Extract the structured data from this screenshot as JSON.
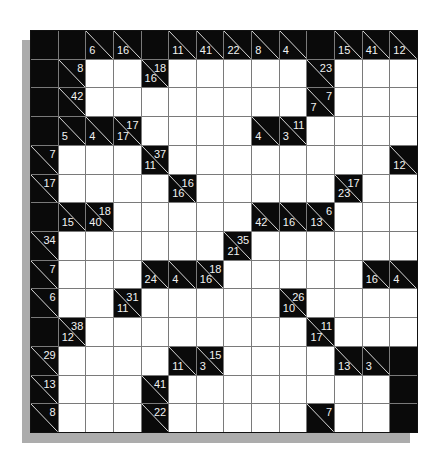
{
  "puzzle": {
    "type": "kakuro",
    "rows": 14,
    "cols": 14,
    "legend": {
      "b": "black-cell",
      "w": "white-entry-cell",
      "clue": "d = down sum (lower-left), a = across sum (upper-right)"
    },
    "grid": [
      [
        "b",
        "b",
        {
          "d": "6"
        },
        {
          "d": "16"
        },
        "b",
        {
          "d": "11"
        },
        {
          "d": "41"
        },
        {
          "d": "22"
        },
        {
          "d": "8"
        },
        {
          "d": "4"
        },
        "b",
        {
          "d": "15"
        },
        {
          "d": "41"
        },
        {
          "d": "12"
        }
      ],
      [
        "b",
        {
          "a": "8"
        },
        "w",
        "w",
        {
          "d": "16",
          "a": "18"
        },
        "w",
        "w",
        "w",
        "w",
        "w",
        {
          "a": "23"
        },
        "w",
        "w",
        "w"
      ],
      [
        "b",
        {
          "a": "42"
        },
        "w",
        "w",
        "w",
        "w",
        "w",
        "w",
        "w",
        "w",
        {
          "d": "7",
          "a": "7"
        },
        "w",
        "w",
        "w"
      ],
      [
        "b",
        {
          "d": "5"
        },
        {
          "d": "4"
        },
        {
          "d": "17",
          "a": "17"
        },
        "w",
        "w",
        "w",
        "w",
        {
          "d": "4"
        },
        {
          "d": "3",
          "a": "11"
        },
        "w",
        "w",
        "w",
        "w"
      ],
      [
        {
          "a": "7"
        },
        "w",
        "w",
        "w",
        {
          "d": "11",
          "a": "37"
        },
        "w",
        "w",
        "w",
        "w",
        "w",
        "w",
        "w",
        "w",
        {
          "d": "12"
        }
      ],
      [
        {
          "a": "17"
        },
        "w",
        "w",
        "w",
        "w",
        {
          "d": "16",
          "a": "16"
        },
        "w",
        "w",
        "w",
        "w",
        "w",
        {
          "d": "23",
          "a": "17"
        },
        "w",
        "w"
      ],
      [
        "b",
        {
          "d": "15"
        },
        {
          "d": "40",
          "a": "18"
        },
        "w",
        "w",
        "w",
        "w",
        "w",
        {
          "d": "42"
        },
        {
          "d": "16"
        },
        {
          "d": "13",
          "a": "6"
        },
        "w",
        "w",
        "w"
      ],
      [
        {
          "a": "34"
        },
        "w",
        "w",
        "w",
        "w",
        "w",
        "w",
        {
          "d": "21",
          "a": "35"
        },
        "w",
        "w",
        "w",
        "w",
        "w",
        "w"
      ],
      [
        {
          "a": "7"
        },
        "w",
        "w",
        "w",
        {
          "d": "24"
        },
        {
          "d": "4"
        },
        {
          "d": "16",
          "a": "18"
        },
        "w",
        "w",
        "w",
        "w",
        "w",
        {
          "d": "16"
        },
        {
          "d": "4"
        }
      ],
      [
        {
          "a": "6"
        },
        "w",
        "w",
        {
          "d": "11",
          "a": "31"
        },
        "w",
        "w",
        "w",
        "w",
        "w",
        {
          "d": "10",
          "a": "26"
        },
        "w",
        "w",
        "w",
        "w"
      ],
      [
        "b",
        {
          "d": "12",
          "a": "38"
        },
        "w",
        "w",
        "w",
        "w",
        "w",
        "w",
        "w",
        "w",
        {
          "d": "17",
          "a": "11"
        },
        "w",
        "w",
        "w"
      ],
      [
        {
          "a": "29"
        },
        "w",
        "w",
        "w",
        "w",
        {
          "d": "11"
        },
        {
          "d": "3",
          "a": "15"
        },
        "w",
        "w",
        "w",
        "w",
        {
          "d": "13"
        },
        {
          "d": "3"
        },
        "b"
      ],
      [
        {
          "a": "13"
        },
        "w",
        "w",
        "w",
        {
          "a": "41"
        },
        "w",
        "w",
        "w",
        "w",
        "w",
        "w",
        "w",
        "w",
        "b"
      ],
      [
        {
          "a": "8"
        },
        "w",
        "w",
        "w",
        {
          "a": "22"
        },
        "w",
        "w",
        "w",
        "w",
        "w",
        {
          "a": "7"
        },
        "w",
        "w",
        "b"
      ]
    ]
  },
  "colors": {
    "black_cell": "#0a0a0a",
    "white_cell": "#ffffff",
    "grid_line": "#7a7a7a",
    "clue_text": "#f2f2f2",
    "shadow": "#acacac"
  }
}
